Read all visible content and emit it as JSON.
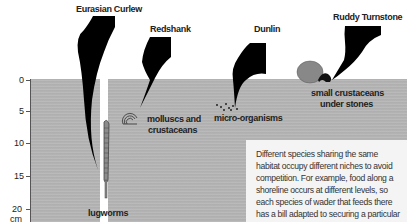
{
  "diagram": {
    "axis": {
      "ticks": [
        {
          "label": "0",
          "value": 0
        },
        {
          "label": "5",
          "value": 5
        },
        {
          "label": "10",
          "value": 10
        },
        {
          "label": "15",
          "value": 15
        },
        {
          "label": "20 cm",
          "value": 20
        }
      ]
    },
    "birds": [
      {
        "name": "Eurasian Curlew",
        "food": "lugworms"
      },
      {
        "name": "Redshank",
        "food": "molluscs and crustaceans"
      },
      {
        "name": "Dunlin",
        "food": "micro-organisms"
      },
      {
        "name": "Ruddy Turnstone",
        "food": "small crustaceans under stones"
      }
    ],
    "labels": {
      "curlew": "Eurasian Curlew",
      "redshank": "Redshank",
      "dunlin": "Dunlin",
      "turnstone": "Ruddy Turnstone",
      "lugworms": "lugworms",
      "molluscs_line1": "molluscs and",
      "molluscs_line2": "crustaceans",
      "micro": "micro-organisms",
      "crust_line1": "small crustaceans",
      "crust_line2": "under stones"
    },
    "note": "Different species sharing the same habitat occupy different niches to avoid competition. For example, food along a shoreline occurs at different levels, so each species of wader that feeds there has a bill adapted to securing a particular meal."
  }
}
